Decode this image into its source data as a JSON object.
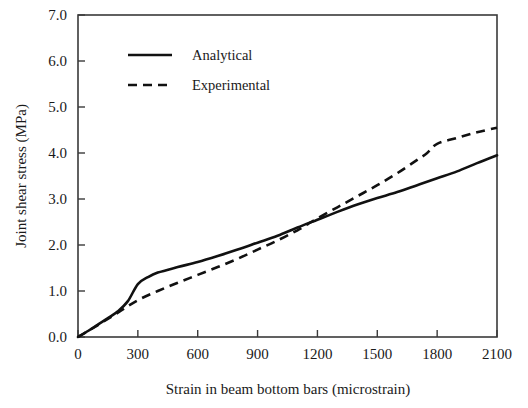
{
  "chart_data": {
    "type": "line",
    "title": "",
    "xlabel": "Strain in beam bottom bars (microstrain)",
    "ylabel": "Joint shear stress (MPa)",
    "xlim": [
      0,
      2100
    ],
    "ylim": [
      0.0,
      7.0
    ],
    "xticks": [
      0,
      300,
      600,
      900,
      1200,
      1500,
      1800,
      2100
    ],
    "xtick_labels": [
      "0",
      "300",
      "600",
      "900",
      "1200",
      "1500",
      "1800",
      "2100"
    ],
    "yticks": [
      0.0,
      1.0,
      2.0,
      3.0,
      4.0,
      5.0,
      6.0,
      7.0
    ],
    "ytick_labels": [
      "0.0",
      "1.0",
      "2.0",
      "3.0",
      "4.0",
      "5.0",
      "6.0",
      "7.0"
    ],
    "grid": false,
    "legend_position": "upper-left-inside",
    "series": [
      {
        "name": "Analytical",
        "style": "solid",
        "color": "#111111",
        "x": [
          0,
          50,
          100,
          150,
          200,
          250,
          300,
          350,
          400,
          500,
          600,
          700,
          800,
          900,
          1000,
          1100,
          1200,
          1300,
          1400,
          1500,
          1600,
          1700,
          1800,
          1900,
          2000,
          2100
        ],
        "y": [
          0.0,
          0.13,
          0.27,
          0.41,
          0.56,
          0.78,
          1.15,
          1.3,
          1.4,
          1.52,
          1.63,
          1.76,
          1.9,
          2.05,
          2.2,
          2.38,
          2.55,
          2.72,
          2.88,
          3.02,
          3.15,
          3.3,
          3.45,
          3.6,
          3.78,
          3.95
        ]
      },
      {
        "name": "Experimental",
        "style": "dashed",
        "color": "#111111",
        "x": [
          0,
          100,
          200,
          300,
          400,
          500,
          600,
          700,
          800,
          900,
          1000,
          1100,
          1150,
          1200,
          1300,
          1400,
          1500,
          1600,
          1700,
          1750,
          1800,
          1900,
          2000,
          2100
        ],
        "y": [
          0.0,
          0.26,
          0.53,
          0.8,
          1.0,
          1.18,
          1.35,
          1.52,
          1.7,
          1.9,
          2.1,
          2.32,
          2.45,
          2.58,
          2.82,
          3.06,
          3.3,
          3.56,
          3.85,
          4.0,
          4.2,
          4.33,
          4.45,
          4.55
        ]
      }
    ]
  },
  "legend": {
    "entries": [
      {
        "label": "Analytical",
        "style": "solid"
      },
      {
        "label": "Experimental",
        "style": "dashed"
      }
    ]
  },
  "axes": {
    "x_title": "Strain in beam bottom bars (microstrain)",
    "y_title": "Joint shear stress (MPa)"
  }
}
